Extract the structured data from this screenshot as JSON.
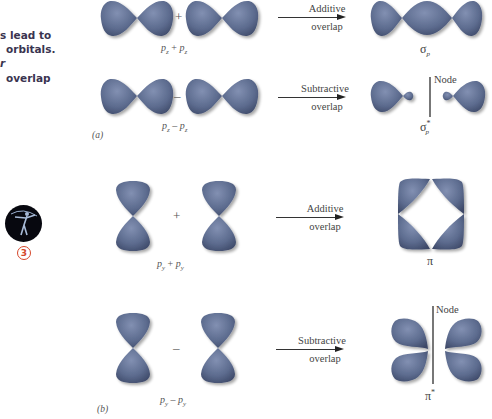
{
  "sidebar": {
    "lines": [
      "s lead to",
      "orbitals.",
      "r",
      "overlap"
    ],
    "badge_number": "3",
    "colors": {
      "text": "#3a3450",
      "badge": "#d5462a"
    }
  },
  "panel_a": {
    "label": "(a)",
    "row1": {
      "operator": "+",
      "equation": {
        "left": "p",
        "left_sub": "z",
        "op": "+",
        "right": "p",
        "right_sub": "z"
      },
      "arrow": {
        "line1": "Additive",
        "line2": "overlap"
      },
      "result": {
        "symbol": "σ",
        "sub": "p",
        "sup": ""
      }
    },
    "row2": {
      "operator": "–",
      "equation": {
        "left": "p",
        "left_sub": "z",
        "op": "–",
        "right": "p",
        "right_sub": "z"
      },
      "arrow": {
        "line1": "Subtractive",
        "line2": "overlap"
      },
      "node_label": "Node",
      "result": {
        "symbol": "σ",
        "sub": "p",
        "sup": "*"
      }
    }
  },
  "panel_b": {
    "label": "(b)",
    "row1": {
      "operator": "+",
      "equation": {
        "left": "p",
        "left_sub": "y",
        "op": "+",
        "right": "p",
        "right_sub": "y"
      },
      "arrow": {
        "line1": "Additive",
        "line2": "overlap"
      },
      "result": {
        "symbol": "π",
        "sup": ""
      }
    },
    "row2": {
      "operator": "–",
      "equation": {
        "left": "p",
        "left_sub": "y",
        "op": "–",
        "right": "p",
        "right_sub": "y"
      },
      "arrow": {
        "line1": "Subtractive",
        "line2": "overlap"
      },
      "node_label": "Node",
      "result": {
        "symbol": "π",
        "sup": "*"
      }
    }
  },
  "colors": {
    "lobe": "#5c6b8e",
    "lobe_dark": "#3f4b6a",
    "lobe_light": "#7f8db0",
    "node_line": "#777777"
  }
}
